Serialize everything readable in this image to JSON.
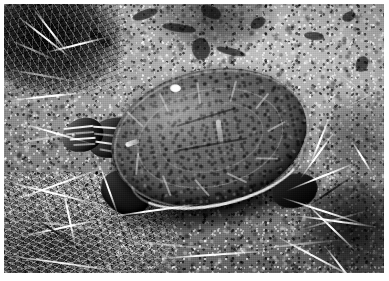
{
  "image": {
    "kind": "photograph",
    "color_mode": "black-and-white",
    "width_px": 389,
    "height_px": 281,
    "border": {
      "style": "white margin",
      "width_px": 4,
      "color": "#ffffff"
    },
    "caption": "Black-and-white photograph of a turtle resting on bare rocky soil among dry grass",
    "alt_text": "A painted turtle with a broad oval carapace sits on gravelly dirt ground, head turned toward the left, surrounded by dry grass blades and small stones."
  },
  "subject": {
    "name": "turtle",
    "common_name": "Painted turtle",
    "orientation": "head toward lower left, shell filling the centre of the frame",
    "parts": [
      {
        "name": "carapace",
        "label": "Shell (carapace)",
        "tone": "dark grey with lighter mottled scutes"
      },
      {
        "name": "scute-seams",
        "label": "Scute seam lines",
        "tone": "light grey outlines"
      },
      {
        "name": "marginal-rim",
        "label": "Marginal scute rim",
        "tone": "bright highlighted lower edge"
      },
      {
        "name": "head",
        "label": "Head",
        "tone": "dark with pale stripes"
      },
      {
        "name": "neck",
        "label": "Neck",
        "tone": "dark grey, striped"
      },
      {
        "name": "eye",
        "label": "Eye",
        "tone": "small dark dot"
      },
      {
        "name": "front-leg",
        "label": "Front leg",
        "tone": "deep shadow"
      },
      {
        "name": "rear-leg",
        "label": "Rear leg",
        "tone": "deep shadow"
      }
    ]
  },
  "background": {
    "name": "ground",
    "label": "Rocky dirt ground",
    "elements": [
      {
        "name": "gravel",
        "label": "Gravel and grit"
      },
      {
        "name": "pebbles",
        "label": "Pale embedded pebbles"
      },
      {
        "name": "soil-cracks",
        "label": "Dark soil clods and cracks"
      },
      {
        "name": "dry-grass",
        "label": "Dry grass and straw"
      },
      {
        "name": "shadow-vegetation",
        "label": "Dark vegetation patches"
      }
    ],
    "regions": [
      {
        "name": "upper-left",
        "label": "Dark vegetation with bright stems"
      },
      {
        "name": "upper-right",
        "label": "Bright gravelly soil with stones"
      },
      {
        "name": "lower-left",
        "label": "Matted dry straw"
      },
      {
        "name": "lower-right",
        "label": "Radiating pale grass blades over dark soil"
      }
    ]
  },
  "palette": {
    "white_border": "#ffffff",
    "highlight": "#fbfbfb",
    "light_soil": "#b9b9b9",
    "mid_soil": "#8c8c8c",
    "shell_mid": "#686868",
    "shell_dark": "#333333",
    "shadow": "#141414",
    "black": "#0a0a0a"
  },
  "text": {
    "overlays": [],
    "watermark": null,
    "caption_visible": false
  }
}
